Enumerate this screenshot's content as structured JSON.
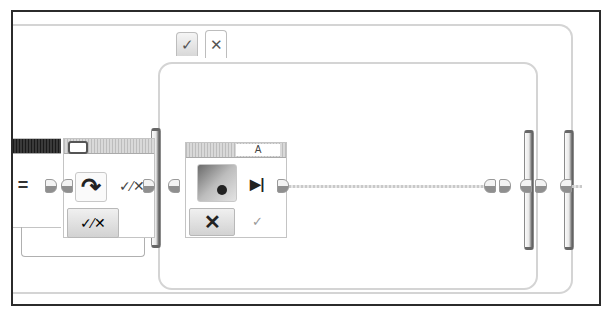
{
  "canvas": {
    "title": "EV3 program canvas",
    "colors": {
      "frame": "#2b2b2b",
      "wire": "#c9c9c9",
      "block_header": "#bdbdbd",
      "compare_header": "#1a1a1a"
    }
  },
  "switch_block": {
    "tabs": [
      {
        "label": "✓",
        "case": "true",
        "icon": "check-icon"
      },
      {
        "label": "✕",
        "case": "false",
        "icon": "cross-icon"
      }
    ]
  },
  "compare_block": {
    "operator": "="
  },
  "logic_block": {
    "mode_icon": "loop-arrow-icon",
    "mode_symbol": "↷",
    "output_symbol": "✓⁄✕",
    "param_symbol": "✓⁄✕"
  },
  "motor_block": {
    "port_label": "A",
    "mode_icon": "stop-step-icon",
    "mode_symbol": "▶|",
    "param_symbol": "✕",
    "output_symbol": "✓"
  }
}
